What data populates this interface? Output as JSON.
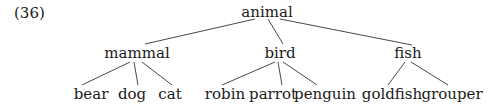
{
  "example_number": "(36)",
  "tree": {
    "root": "animal",
    "children": [
      {
        "label": "mammal",
        "children": [
          "bear",
          "dog",
          "cat"
        ]
      },
      {
        "label": "bird",
        "children": [
          "robin",
          "parrot",
          "penguin"
        ]
      },
      {
        "label": "fish",
        "children": [
          "goldfish",
          "grouper"
        ]
      }
    ]
  },
  "nodes": {
    "root": "animal",
    "mammal": "mammal",
    "bird": "bird",
    "fish": "fish",
    "bear": "bear",
    "dog": "dog",
    "cat": "cat",
    "robin": "robin",
    "parrot": "parrot",
    "penguin": "penguin",
    "goldfish": "goldfish",
    "grouper": "grouper"
  }
}
